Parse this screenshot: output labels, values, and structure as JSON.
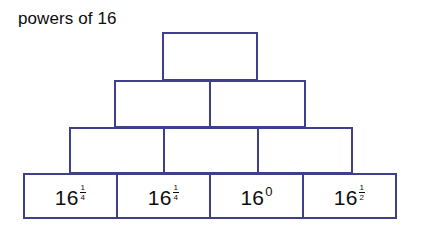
{
  "figure": {
    "title": "powers of 16",
    "background_color": "#ffffff",
    "border_color": "#3f3f8c",
    "text_color": "#0d0d0d"
  },
  "pyramid": {
    "rows": [
      {
        "row_index": 1,
        "cell_count": 1,
        "cells": [
          {
            "label": "",
            "base": "",
            "exponent": "",
            "filled": false
          }
        ]
      },
      {
        "row_index": 2,
        "cell_count": 2,
        "cells": [
          {
            "label": "",
            "base": "",
            "exponent": "",
            "filled": false
          },
          {
            "label": "",
            "base": "",
            "exponent": "",
            "filled": false
          }
        ]
      },
      {
        "row_index": 3,
        "cell_count": 3,
        "cells": [
          {
            "label": "",
            "base": "",
            "exponent": "",
            "filled": false
          },
          {
            "label": "",
            "base": "",
            "exponent": "",
            "filled": false
          },
          {
            "label": "",
            "base": "",
            "exponent": "",
            "filled": false
          }
        ]
      },
      {
        "row_index": 4,
        "cell_count": 4,
        "cells": [
          {
            "label": "16^(1/4)",
            "base": "16",
            "exponent": "1/4",
            "exponent_numerator": "1",
            "exponent_denominator": "4",
            "filled": true
          },
          {
            "label": "16^(1/4)",
            "base": "16",
            "exponent": "1/4",
            "exponent_numerator": "1",
            "exponent_denominator": "4",
            "filled": true
          },
          {
            "label": "16^0",
            "base": "16",
            "exponent": "0",
            "filled": true
          },
          {
            "label": "16^(1/2)",
            "base": "16",
            "exponent": "1/2",
            "exponent_numerator": "1",
            "exponent_denominator": "2",
            "filled": true
          }
        ]
      }
    ]
  }
}
